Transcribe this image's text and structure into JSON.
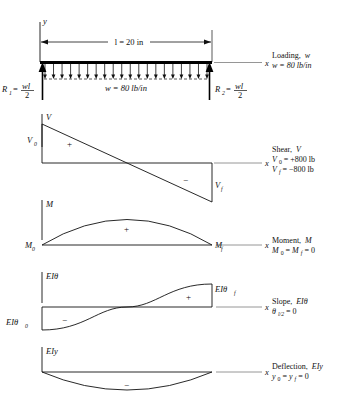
{
  "figure": {
    "axis_label_x": "x",
    "axis_label_y": "y",
    "beam": {
      "length_label": "l = 20 in",
      "load_label": "w = 80 lb/in",
      "reaction_left": "R",
      "reaction_left_sub": "1",
      "reaction_right": "R",
      "reaction_right_sub": "2",
      "reaction_value_num": "wl",
      "reaction_value_den": "2",
      "equals": "=",
      "load_arrow_count": 20
    },
    "diagrams": [
      {
        "key": "loading",
        "axis_label": "w",
        "caption_line1": "Loading, w",
        "caption_line2": "w = 80 lb/in",
        "left_label": "",
        "right_label": ""
      },
      {
        "key": "shear",
        "axis_label": "V",
        "caption_line1": "Shear, V",
        "caption_line2": "V0 = +800 lb",
        "caption_line3": "Vf = −800 lb",
        "left_label": "V",
        "left_label_sub": "0",
        "right_label": "V",
        "right_label_sub": "f",
        "sign_positive": "+",
        "sign_negative": "−"
      },
      {
        "key": "moment",
        "axis_label": "M",
        "caption_line1": "Moment, M",
        "caption_line2": "M0 = Mf = 0",
        "left_label": "M",
        "left_label_sub": "0",
        "right_label": "M",
        "right_label_sub": "f",
        "sign_positive": "+"
      },
      {
        "key": "slope",
        "axis_label": "EIθ",
        "caption_line1": "Slope, EIθ",
        "caption_line2": "θl/2 = 0",
        "left_label": "EIθ",
        "left_label_sub": "0",
        "right_label": "EIθ",
        "right_label_sub": "f",
        "sign_positive": "+",
        "sign_negative": "−"
      },
      {
        "key": "deflection",
        "axis_label": "EIy",
        "caption_line1": "Deflection, EIy",
        "caption_line2": "y0 = yf = 0",
        "left_label": "",
        "right_label": "",
        "sign_negative": "−"
      }
    ],
    "captions": {
      "loading_1": "Loading,",
      "loading_1b": "w",
      "loading_2": "w = 80 lb/in",
      "shear_1": "Shear,",
      "shear_1b": "V",
      "shear_2a": "V",
      "shear_2b": "0",
      "shear_2c": " = +800 lb",
      "shear_3a": "V",
      "shear_3b": "f",
      "shear_3c": " = −800 lb",
      "moment_1": "Moment,",
      "moment_1b": "M",
      "moment_2a": "M",
      "moment_2b": "0",
      "moment_2c": " = ",
      "moment_2d": "M",
      "moment_2e": "f",
      "moment_2f": " = 0",
      "slope_1": "Slope,",
      "slope_1b": "EIθ",
      "slope_2a": "θ",
      "slope_2b": "l/2",
      "slope_2c": " = 0",
      "deflection_1": "Deflection,",
      "deflection_1b": "EIy",
      "deflection_2a": "y",
      "deflection_2b": "0",
      "deflection_2c": " = ",
      "deflection_2d": "y",
      "deflection_2e": "f",
      "deflection_2f": " = 0"
    },
    "colors": {
      "line": "#111111",
      "curve": "#1a1a1a",
      "beam": "#000000",
      "background": "#ffffff"
    }
  }
}
